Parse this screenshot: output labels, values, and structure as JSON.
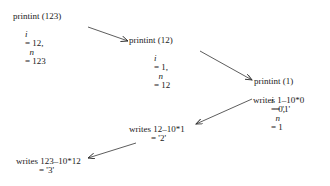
{
  "diagram": {
    "frames": [
      {
        "call": "printint (123)",
        "i_label": "i",
        "i_value": "= 12,",
        "n_label": "n",
        "n_value": "= 123"
      },
      {
        "call": "printint (12)",
        "i_label": "i",
        "i_value": "= 1,",
        "n_label": "n",
        "n_value": "= 12"
      },
      {
        "call": "printint (1)",
        "i_label": "i",
        "i_value": "= 0,",
        "n_label": "n",
        "n_value": "= 1",
        "writes": "writes 1–10*0",
        "result": "= '1'"
      }
    ],
    "returns": [
      {
        "writes": "writes 12–10*1",
        "result": "= '2'"
      },
      {
        "writes": "writes 123–10*12",
        "result": "= '3'"
      }
    ],
    "arrows": [
      {
        "from": "frame-0",
        "to": "frame-1",
        "x1": 88,
        "y1": 27,
        "x2": 128,
        "y2": 41
      },
      {
        "from": "frame-1",
        "to": "frame-2",
        "x1": 200,
        "y1": 51,
        "x2": 252,
        "y2": 80
      },
      {
        "from": "frame-2",
        "to": "return-0",
        "x1": 252,
        "y1": 99,
        "x2": 196,
        "y2": 124
      },
      {
        "from": "return-0",
        "to": "return-1",
        "x1": 136,
        "y1": 143,
        "x2": 88,
        "y2": 158
      }
    ],
    "line_color": "#333333"
  }
}
